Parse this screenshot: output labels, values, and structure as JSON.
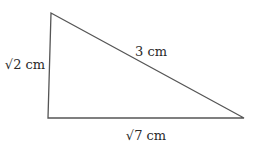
{
  "diagram": {
    "type": "right-triangle",
    "stroke_color": "#555555",
    "text_color": "#2a2a2a",
    "vertices": {
      "top_left": [
        51,
        13
      ],
      "bottom_left": [
        48,
        118
      ],
      "bottom_right": [
        244,
        118
      ]
    },
    "labels": {
      "left_side": "√2 cm",
      "hypotenuse": "3 cm",
      "bottom_side": "√7 cm"
    }
  }
}
